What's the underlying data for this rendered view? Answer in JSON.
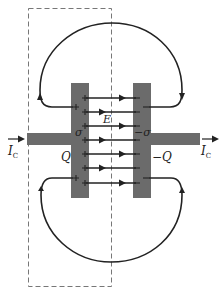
{
  "diagram": {
    "colors": {
      "plate": "#6b6b6b",
      "wire": "#6b6b6b",
      "line": "#222222",
      "dashed": "#777777",
      "background": "#ffffff"
    },
    "labels": {
      "current_in": "I",
      "current_in_sub": "C",
      "current_out": "I",
      "current_out_sub": "C",
      "field": "E",
      "sigma_left": "σ",
      "sigma_right": "−σ",
      "charge_left": "Q",
      "charge_right": "−Q"
    },
    "plates": [
      {
        "name": "left-plate",
        "sign": "+",
        "charge": "Q"
      },
      {
        "name": "right-plate",
        "sign": "−",
        "charge": "−Q"
      }
    ],
    "field_lines_count": 7,
    "loops": [
      "upper-loop",
      "lower-loop"
    ],
    "surface": "dashed-gaussian-surface"
  }
}
